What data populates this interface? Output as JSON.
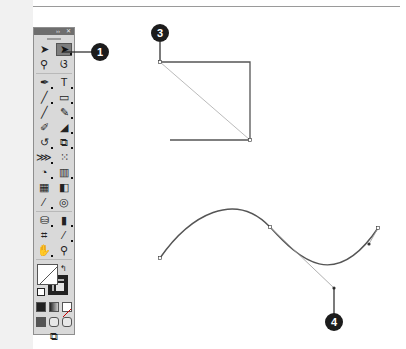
{
  "panel": {
    "header_buttons": [
      "››",
      "✕"
    ],
    "tool_rows": [
      [
        {
          "name": "selection-tool",
          "glyph": "➤",
          "active": false,
          "flyout": false
        },
        {
          "name": "direct-selection-tool",
          "glyph": "➤",
          "active": true,
          "flyout": true
        }
      ],
      [
        {
          "name": "magic-wand-tool",
          "glyph": "⚲",
          "active": false,
          "flyout": false
        },
        {
          "name": "lasso-tool",
          "glyph": "ଓ",
          "active": false,
          "flyout": false
        }
      ],
      [
        {
          "name": "pen-tool",
          "glyph": "✒",
          "active": false,
          "flyout": true
        },
        {
          "name": "type-tool",
          "glyph": "T",
          "active": false,
          "flyout": true
        }
      ],
      [
        {
          "name": "line-segment-tool",
          "glyph": "╱",
          "active": false,
          "flyout": true
        },
        {
          "name": "rectangle-tool",
          "glyph": "▭",
          "active": false,
          "flyout": true
        }
      ],
      [
        {
          "name": "paintbrush-tool",
          "glyph": "╱",
          "active": false,
          "flyout": false
        },
        {
          "name": "pencil-tool",
          "glyph": "✎",
          "active": false,
          "flyout": true
        }
      ],
      [
        {
          "name": "blob-brush-tool",
          "glyph": "✐",
          "active": false,
          "flyout": false
        },
        {
          "name": "eraser-tool",
          "glyph": "◢",
          "active": false,
          "flyout": true
        }
      ],
      [
        {
          "name": "rotate-tool",
          "glyph": "↺",
          "active": false,
          "flyout": true
        },
        {
          "name": "scale-tool",
          "glyph": "⧉",
          "active": false,
          "flyout": true
        }
      ],
      [
        {
          "name": "width-tool",
          "glyph": "⋙",
          "active": false,
          "flyout": true
        },
        {
          "name": "free-transform-tool",
          "glyph": "⁙",
          "active": false,
          "flyout": false
        }
      ],
      [
        {
          "name": "shape-builder-tool",
          "glyph": "◔",
          "active": false,
          "flyout": true
        },
        {
          "name": "perspective-grid-tool",
          "glyph": "▥",
          "active": false,
          "flyout": true
        }
      ],
      [
        {
          "name": "mesh-tool",
          "glyph": "▦",
          "active": false,
          "flyout": false
        },
        {
          "name": "gradient-tool",
          "glyph": "◧",
          "active": false,
          "flyout": false
        }
      ],
      [
        {
          "name": "eyedropper-tool",
          "glyph": "⁄",
          "active": false,
          "flyout": true
        },
        {
          "name": "blend-tool",
          "glyph": "◎",
          "active": false,
          "flyout": false
        }
      ],
      [
        {
          "name": "symbol-sprayer-tool",
          "glyph": "⛁",
          "active": false,
          "flyout": true
        },
        {
          "name": "column-graph-tool",
          "glyph": "▮",
          "active": false,
          "flyout": true
        }
      ],
      [
        {
          "name": "artboard-tool",
          "glyph": "⌗",
          "active": false,
          "flyout": false
        },
        {
          "name": "slice-tool",
          "glyph": "⁄",
          "active": false,
          "flyout": true
        }
      ],
      [
        {
          "name": "hand-tool",
          "glyph": "✋",
          "active": false,
          "flyout": true
        },
        {
          "name": "zoom-tool",
          "glyph": "⚲",
          "active": false,
          "flyout": false
        }
      ]
    ],
    "swap_glyph": "↰",
    "color_modes": [
      "color",
      "gradient",
      "none"
    ],
    "draw_modes": [
      "normal",
      "behind",
      "inside"
    ],
    "screen_mode_glyph": "⧉"
  },
  "callouts": {
    "one": "1",
    "three": "3",
    "four": "4"
  },
  "colors": {
    "callout_bg": "#1c1c1c",
    "path_stroke": "#555555",
    "handle_line": "#9a9a9a"
  }
}
